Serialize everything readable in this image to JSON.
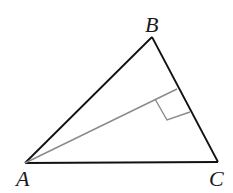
{
  "diagram": {
    "type": "triangle-with-altitude",
    "vertices": [
      {
        "label": "A",
        "x": 25,
        "y": 163,
        "label_x": 16,
        "label_y": 186
      },
      {
        "label": "B",
        "x": 152,
        "y": 37,
        "label_x": 146,
        "label_y": 32
      },
      {
        "label": "C",
        "x": 218,
        "y": 162,
        "label_x": 210,
        "label_y": 186
      }
    ],
    "altitude": {
      "from": "A",
      "to_side": "BC",
      "foot_x": 177,
      "foot_y": 89
    },
    "right_angle_marker": {
      "points": [
        [
          155,
          99
        ],
        [
          167,
          120
        ],
        [
          190,
          112
        ]
      ]
    },
    "colors": {
      "triangle": "#111111",
      "altitude": "#8a8a8a",
      "marker": "#8a8a8a"
    }
  }
}
